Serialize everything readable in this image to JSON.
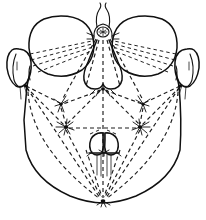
{
  "figure": {
    "view": "frontal",
    "style": "scientific line drawing",
    "background_color": "#ffffff",
    "line_color": "#101010",
    "dashed_line_color": "#1d1d1d",
    "canvas": {
      "width": 206,
      "height": 220
    }
  },
  "anatomy": {
    "head_capsule": {
      "label": "head capsule outline",
      "description": "broad rounded outline, widest across the eyes, tapering to a single ventral apex"
    },
    "compound_eyes": [
      {
        "label": "left compound eye",
        "side": "left",
        "cx": 61,
        "cy": 45,
        "rx": 31,
        "ry": 27
      },
      {
        "label": "right compound eye",
        "side": "right",
        "cx": 145,
        "cy": 45,
        "rx": 31,
        "ry": 27
      }
    ],
    "antennal_sockets": [
      {
        "label": "left antennal base",
        "side": "left",
        "cx": 18,
        "cy": 65,
        "rx": 12,
        "ry": 17
      },
      {
        "label": "right antennal base",
        "side": "right",
        "cx": 188,
        "cy": 65,
        "rx": 12,
        "ry": 17
      }
    ],
    "ocellus": {
      "label": "median ocellus",
      "cx": 103,
      "cy": 32,
      "r": 6
    },
    "antennal_flagella": {
      "label": "antennal flagella pair",
      "description": "two slender curved filaments rising from the median vertex"
    },
    "clypeus": {
      "label": "clypeus / frontoclypeal plate",
      "description": "pear shaped median plate below the ocellus, bilobed at its ventral margin"
    },
    "labial_lobes": [
      {
        "label": "left labial lobe",
        "side": "left",
        "cx": 96,
        "cy": 143,
        "rx": 8,
        "ry": 11
      },
      {
        "label": "right labial lobe",
        "side": "right",
        "cx": 112,
        "cy": 143,
        "rx": 8,
        "ry": 11
      }
    ],
    "stylets": {
      "label": "stylet bundle",
      "count": 4,
      "description": "four parallel slender stylets descending from the labial lobes"
    }
  },
  "chaetotaxy": {
    "description": "dashed triangulation network linking setal landmark points",
    "node_labels": [
      "median vertex node",
      "left supraocular node",
      "right supraocular node",
      "left genal node",
      "right genal node",
      "left frontal seta group",
      "right frontal seta group",
      "left subgenal seta group",
      "right subgenal seta group",
      "clypeal apex node",
      "ventral apex node"
    ],
    "seta_groups": [
      {
        "label": "left frontal seta cluster",
        "x": 61,
        "y": 104,
        "rays": 6
      },
      {
        "label": "right frontal seta cluster",
        "x": 143,
        "y": 104,
        "rays": 6
      },
      {
        "label": "left subgenal seta cluster",
        "x": 66,
        "y": 127,
        "rays": 8
      },
      {
        "label": "right subgenal seta cluster",
        "x": 140,
        "y": 127,
        "rays": 8
      }
    ],
    "landmark_nodes": [
      {
        "label": "median vertex node",
        "x": 103,
        "y": 32
      },
      {
        "label": "clypeal apex node",
        "x": 103,
        "y": 88
      },
      {
        "label": "left genal node",
        "x": 25,
        "y": 86
      },
      {
        "label": "right genal node",
        "x": 181,
        "y": 86
      },
      {
        "label": "ventral apex node",
        "x": 103,
        "y": 201
      }
    ]
  },
  "caption": {
    "text": ""
  }
}
